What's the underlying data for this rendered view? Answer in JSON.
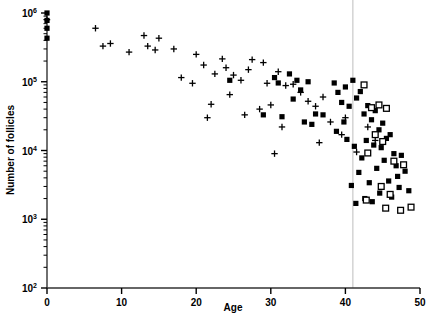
{
  "chart_data": {
    "type": "scatter",
    "title": "",
    "xlabel": "Age",
    "ylabel": "Number of follicles",
    "xlim": [
      0,
      50
    ],
    "ylim": [
      100,
      1000000
    ],
    "yscale": "log",
    "xscale": "linear",
    "grid": false,
    "legend": "none",
    "xticks": [
      0,
      10,
      20,
      30,
      40,
      50
    ],
    "xtick_labels": [
      "0",
      "10",
      "20",
      "30",
      "40",
      "50"
    ],
    "yticks": [
      100,
      1000,
      10000,
      100000,
      1000000
    ],
    "ytick_labels": [
      "10",
      "10",
      "10",
      "10",
      "10"
    ],
    "ytick_exponents": [
      "2",
      "3",
      "4",
      "5",
      "6"
    ],
    "minor_ticks": true,
    "annotations": [
      {
        "name": "menopause-reference-line",
        "type": "vline",
        "x": 41,
        "color": "#c8c8c8"
      }
    ],
    "fit_line": {
      "name": "bilinear-regression",
      "type": "piecewise-linear",
      "color": "#000000",
      "breakpoint_age": 37.5,
      "breakpoint_value": 33000,
      "points": [
        {
          "x": 0,
          "y": 700000
        },
        {
          "x": 37.5,
          "y": 33000
        },
        {
          "x": 50,
          "y": 1150
        }
      ]
    },
    "series": [
      {
        "name": "plus-markers",
        "marker": "plus",
        "color": "#000000",
        "points": [
          [
            0,
            800000
          ],
          [
            6.5,
            600000
          ],
          [
            7.5,
            330000
          ],
          [
            8.5,
            360000
          ],
          [
            11,
            270000
          ],
          [
            13,
            470000
          ],
          [
            13.5,
            330000
          ],
          [
            15,
            430000
          ],
          [
            14.5,
            290000
          ],
          [
            17,
            300000
          ],
          [
            18,
            115000
          ],
          [
            20,
            250000
          ],
          [
            21,
            175000
          ],
          [
            19.5,
            95000
          ],
          [
            22.5,
            130000
          ],
          [
            23.5,
            215000
          ],
          [
            24,
            160000
          ],
          [
            25,
            125000
          ],
          [
            24.5,
            65000
          ],
          [
            26,
            105000
          ],
          [
            27,
            150000
          ],
          [
            27.5,
            210000
          ],
          [
            29,
            190000
          ],
          [
            29.5,
            95000
          ],
          [
            26.5,
            33000
          ],
          [
            28.5,
            40000
          ],
          [
            30,
            46000
          ],
          [
            22,
            47000
          ],
          [
            21.5,
            30000
          ],
          [
            31,
            140000
          ],
          [
            32,
            88000
          ],
          [
            33,
            92000
          ],
          [
            34,
            70000
          ],
          [
            31.5,
            22000
          ],
          [
            35,
            52000
          ],
          [
            36,
            44000
          ],
          [
            37,
            60000
          ],
          [
            38,
            26000
          ],
          [
            39.5,
            17000
          ],
          [
            40,
            30000
          ],
          [
            41.5,
            9500
          ],
          [
            43,
            22000
          ],
          [
            44,
            14000
          ],
          [
            36.5,
            13000
          ],
          [
            30.5,
            9000
          ]
        ]
      },
      {
        "name": "filled-square-markers",
        "marker": "filled-square",
        "color": "#000000",
        "points": [
          [
            0,
            1000000
          ],
          [
            0,
            780000
          ],
          [
            0,
            600000
          ],
          [
            0,
            430000
          ],
          [
            24.5,
            105000
          ],
          [
            30.5,
            115000
          ],
          [
            31,
            96000
          ],
          [
            32.5,
            130000
          ],
          [
            33.5,
            105000
          ],
          [
            34,
            76000
          ],
          [
            35,
            100000
          ],
          [
            33,
            56000
          ],
          [
            29,
            33000
          ],
          [
            31.5,
            31000
          ],
          [
            36,
            34000
          ],
          [
            37,
            33000
          ],
          [
            34.5,
            26000
          ],
          [
            35.5,
            24000
          ],
          [
            38.5,
            96000
          ],
          [
            39,
            70000
          ],
          [
            40,
            84000
          ],
          [
            39.5,
            50000
          ],
          [
            40.5,
            44000
          ],
          [
            41,
            105000
          ],
          [
            42,
            72000
          ],
          [
            41.5,
            58000
          ],
          [
            42.5,
            34000
          ],
          [
            43,
            45000
          ],
          [
            43.5,
            28000
          ],
          [
            44,
            38000
          ],
          [
            44.5,
            20000
          ],
          [
            45,
            25000
          ],
          [
            45.5,
            15000
          ],
          [
            44.8,
            11000
          ],
          [
            46,
            17000
          ],
          [
            46.5,
            9000
          ],
          [
            42.8,
            14000
          ],
          [
            43.8,
            12000
          ],
          [
            45.2,
            7200
          ],
          [
            46.8,
            6000
          ],
          [
            47.5,
            8500
          ],
          [
            48,
            5000
          ],
          [
            47,
            4200
          ],
          [
            44.2,
            5500
          ],
          [
            42.2,
            7800
          ],
          [
            41.8,
            4800
          ],
          [
            43.2,
            3400
          ],
          [
            45.8,
            3600
          ],
          [
            47.2,
            2900
          ],
          [
            40.8,
            3100
          ],
          [
            44.6,
            2400
          ],
          [
            46.2,
            2100
          ],
          [
            48.5,
            2600
          ],
          [
            42.6,
            2000
          ],
          [
            39.8,
            26000
          ],
          [
            38.8,
            19000
          ],
          [
            40.2,
            14500
          ],
          [
            41.2,
            11500
          ],
          [
            43.6,
            1800
          ],
          [
            41.4,
            1700
          ]
        ]
      },
      {
        "name": "open-square-markers",
        "marker": "open-square",
        "color": "#000000",
        "points": [
          [
            42.5,
            90000
          ],
          [
            44.5,
            46000
          ],
          [
            43.5,
            42000
          ],
          [
            45.5,
            41000
          ],
          [
            44,
            17000
          ],
          [
            45,
            13500
          ],
          [
            43,
            9200
          ],
          [
            46.5,
            7000
          ],
          [
            47.8,
            6200
          ],
          [
            44.8,
            3000
          ],
          [
            46,
            2300
          ],
          [
            45.4,
            1450
          ],
          [
            47.4,
            1350
          ],
          [
            48.8,
            1500
          ],
          [
            42.8,
            1900
          ]
        ]
      }
    ]
  },
  "axes": {
    "x_title": "Age",
    "y_title": "Number of follicles",
    "y_base": "10"
  }
}
